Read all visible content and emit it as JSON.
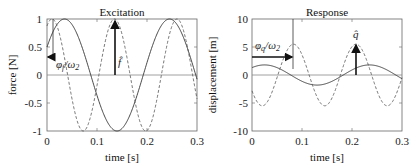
{
  "chart_data": [
    {
      "type": "line",
      "title": "Excitation",
      "xlabel": "time   [s]",
      "ylabel": "force [N]",
      "xlim": [
        0,
        0.3
      ],
      "ylim": [
        -1,
        1
      ],
      "xticks": [
        "0",
        "0.1",
        "0.2",
        "0.3"
      ],
      "yticks": [
        "-1",
        "-0.5",
        "0",
        "0.5",
        "1"
      ],
      "grid": false,
      "series": [
        {
          "name": "solid",
          "style": "solid",
          "amplitude": 1.0,
          "period": 0.21,
          "peak_at": 0.035
        },
        {
          "name": "dashed",
          "style": "dashed",
          "amplitude": 1.0,
          "period": 0.125,
          "peak_at": 0.01
        }
      ],
      "annotations": [
        {
          "text": "φf/ω2",
          "type": "arrow",
          "x_from": 0.01,
          "x_to": 0,
          "y": 0.32
        },
        {
          "text": "f̂",
          "type": "arrow",
          "x": 0.135,
          "y_from": 0,
          "y_to": 1
        }
      ]
    },
    {
      "type": "line",
      "title": "Response",
      "xlabel": "time   [s]",
      "ylabel": "displacement [m]",
      "xlim": [
        0,
        0.3
      ],
      "ylim": [
        -10,
        10
      ],
      "xticks": [
        "0",
        "0.1",
        "0.2",
        "0.3"
      ],
      "yticks": [
        "-10",
        "-5",
        "0",
        "5",
        "10"
      ],
      "grid": false,
      "series": [
        {
          "name": "solid",
          "style": "solid",
          "amplitude": 1.8,
          "period": 0.21,
          "peak_at": 0.025
        },
        {
          "name": "dashed",
          "style": "dashed",
          "amplitude": 5.5,
          "period": 0.125,
          "peak_at": 0.083
        }
      ],
      "annotations": [
        {
          "text": "φq/ω2",
          "type": "arrow",
          "x_from": 0,
          "x_to": 0.083,
          "y": 3.2
        },
        {
          "text": "q̂",
          "type": "arrow",
          "x": 0.208,
          "y_from": 0,
          "y_to": 5.5
        }
      ]
    }
  ],
  "left": {
    "title": "Excitation",
    "xlabel": "time   [s]",
    "ylabel": "force [N]",
    "xticks": [
      "0",
      "0.1",
      "0.2",
      "0.3"
    ],
    "yticks": [
      "1",
      "0.5",
      "0",
      "-0.5",
      "-1"
    ],
    "ann_phase": "φ",
    "ann_phase_sub": "f",
    "ann_phase_den": "/ω",
    "ann_phase_den_sub": "2",
    "ann_amp": "f̂"
  },
  "right": {
    "title": "Response",
    "xlabel": "time   [s]",
    "ylabel": "displacement [m]",
    "xticks": [
      "0",
      "0.1",
      "0.2",
      "0.3"
    ],
    "yticks": [
      "10",
      "5",
      "0",
      "-5",
      "-10"
    ],
    "ann_phase": "φ",
    "ann_phase_sub": "q",
    "ann_phase_den": "/ω",
    "ann_phase_den_sub": "2",
    "ann_amp": "q̂"
  }
}
